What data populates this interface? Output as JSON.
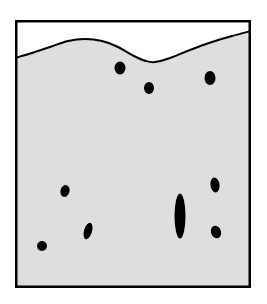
{
  "figure": {
    "canvas": {
      "width": 267,
      "height": 304,
      "background": "#ffffff"
    },
    "frame": {
      "name": "outer-rectangle-border",
      "x": 15,
      "y": 20,
      "width": 236,
      "height": 268,
      "stroke": "#000000",
      "stroke_width": 2.5,
      "fill": "#ffffff"
    },
    "regions": [
      {
        "name": "upper-white-region",
        "label": "white region above boundary",
        "fill": "#ffffff"
      },
      {
        "name": "lower-gray-region",
        "label": "gray medium below boundary",
        "fill": "#dedede"
      }
    ],
    "boundary_curve": {
      "name": "wavy-boundary-line",
      "stroke": "#000000",
      "stroke_width": 2,
      "description": "undulating curve: rises from left edge to a crest near x=85, dips to a trough near x=152, then rises to the right edge",
      "points": [
        [
          15,
          58
        ],
        [
          32,
          53
        ],
        [
          50,
          47
        ],
        [
          68,
          41
        ],
        [
          85,
          39
        ],
        [
          102,
          41
        ],
        [
          118,
          47
        ],
        [
          134,
          56
        ],
        [
          146,
          61
        ],
        [
          155,
          62
        ],
        [
          170,
          58
        ],
        [
          190,
          50
        ],
        [
          212,
          42
        ],
        [
          232,
          36
        ],
        [
          251,
          31
        ]
      ]
    },
    "inclusions": [
      {
        "name": "inclusion-1",
        "cx": 120,
        "cy": 68,
        "rx": 5.5,
        "ry": 6.5,
        "rotation": 0,
        "fill": "#000000"
      },
      {
        "name": "inclusion-2",
        "cx": 149,
        "cy": 88,
        "rx": 5.0,
        "ry": 6.0,
        "rotation": 0,
        "fill": "#000000"
      },
      {
        "name": "inclusion-3",
        "cx": 210,
        "cy": 78,
        "rx": 5.5,
        "ry": 7.0,
        "rotation": 0,
        "fill": "#000000"
      },
      {
        "name": "inclusion-4",
        "cx": 65,
        "cy": 191,
        "rx": 4.5,
        "ry": 6.0,
        "rotation": 15,
        "fill": "#000000"
      },
      {
        "name": "inclusion-5",
        "cx": 215,
        "cy": 185,
        "rx": 4.5,
        "ry": 7.5,
        "rotation": -8,
        "fill": "#000000"
      },
      {
        "name": "inclusion-6",
        "cx": 180,
        "cy": 216,
        "rx": 5.5,
        "ry": 22.5,
        "rotation": 0,
        "fill": "#000000"
      },
      {
        "name": "inclusion-7",
        "cx": 88,
        "cy": 231,
        "rx": 4.0,
        "ry": 8.5,
        "rotation": 16,
        "fill": "#000000"
      },
      {
        "name": "inclusion-8",
        "cx": 216,
        "cy": 232,
        "rx": 5.0,
        "ry": 6.5,
        "rotation": -20,
        "fill": "#000000"
      },
      {
        "name": "inclusion-9",
        "cx": 42,
        "cy": 246,
        "rx": 5.0,
        "ry": 5.0,
        "rotation": 0,
        "fill": "#000000"
      }
    ],
    "colors": {
      "line": "#000000",
      "gray_fill": "#dedede",
      "white_fill": "#ffffff",
      "inclusion_fill": "#000000"
    }
  }
}
